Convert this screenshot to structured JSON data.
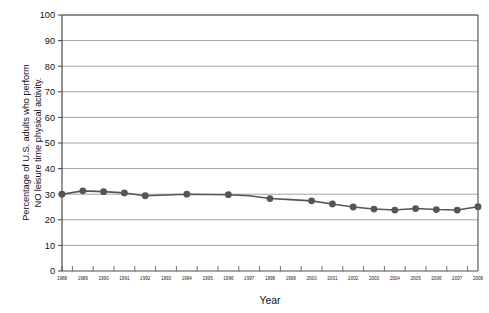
{
  "chart_data": {
    "type": "line",
    "title": "",
    "xlabel": "Year",
    "ylabel": "Percentage of U.S. adults who perform NO leisure time physical activity.",
    "ylabel_line1": "Percentage of U.S. adults who perform",
    "ylabel_line2": "NO leisure time physical activity.",
    "categories": [
      "1988",
      "1989",
      "1990",
      "1991",
      "1992",
      "1993",
      "1994",
      "1995",
      "1996",
      "1997",
      "1998",
      "1999",
      "2000",
      "2001",
      "2002",
      "2003",
      "2004",
      "2005",
      "2006",
      "2007",
      "2008"
    ],
    "x": [
      1988,
      1989,
      1990,
      1991,
      1992,
      1993,
      1994,
      1995,
      1996,
      1997,
      1998,
      1999,
      2000,
      2001,
      2002,
      2003,
      2004,
      2005,
      2006,
      2007,
      2008
    ],
    "values": [
      30.0,
      31.3,
      31.0,
      30.5,
      29.4,
      29.7,
      30.0,
      29.9,
      29.8,
      29.4,
      28.3,
      27.9,
      27.4,
      26.2,
      25.0,
      24.2,
      23.8,
      24.4,
      24.0,
      23.8,
      25.1
    ],
    "markers_at": [
      1988,
      1989,
      1990,
      1991,
      1992,
      1994,
      1996,
      1998,
      2000,
      2001,
      2002,
      2003,
      2004,
      2005,
      2006,
      2007,
      2008
    ],
    "ylim": [
      0,
      100
    ],
    "yticks": [
      0,
      10,
      20,
      30,
      40,
      50,
      60,
      70,
      80,
      90,
      100
    ],
    "ytick_labels": [
      "0",
      "10",
      "20",
      "30",
      "40",
      "50",
      "60",
      "70",
      "80",
      "90",
      "100"
    ],
    "grid": true,
    "grid_axis": "y",
    "legend": "none",
    "series_color": "#555555",
    "grid_color": "#999999",
    "axis_color": "#4d4d4d"
  }
}
